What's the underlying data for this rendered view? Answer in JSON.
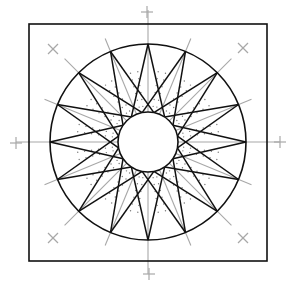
{
  "diagram": {
    "canvas": {
      "width": 294,
      "height": 289,
      "background": "#ffffff"
    },
    "square": {
      "x": 29,
      "y": 24,
      "width": 238,
      "height": 237
    },
    "center": {
      "x": 148,
      "y": 142
    },
    "outer_circle_radius": 98,
    "inner_circle_radius": 30,
    "star_points": 16,
    "tip_offset_deg": 33.75,
    "registration_marks": {
      "plus": [
        {
          "x": 147,
          "y": 12
        },
        {
          "x": 149,
          "y": 274
        },
        {
          "x": 16,
          "y": 143
        },
        {
          "x": 280,
          "y": 142
        }
      ],
      "cross": [
        {
          "x": 53,
          "y": 49
        },
        {
          "x": 243,
          "y": 48
        },
        {
          "x": 53,
          "y": 238
        },
        {
          "x": 243,
          "y": 238
        }
      ]
    },
    "colors": {
      "line": "#111111",
      "guide": "#a8a8a8",
      "dots": "#777777"
    }
  }
}
